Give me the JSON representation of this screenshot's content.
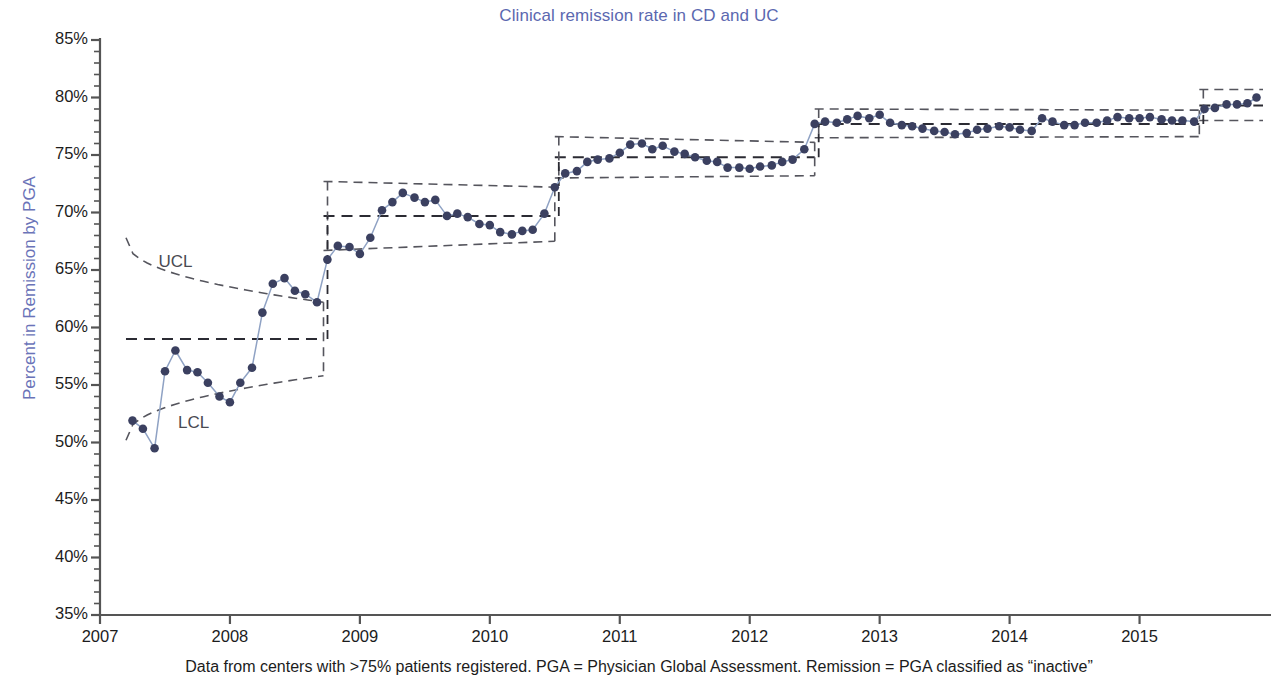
{
  "chart_data": {
    "type": "line",
    "title": "Clinical remission rate in CD and UC",
    "xlabel": "",
    "ylabel": "Percent in Remission by PGA",
    "footnote": "Data from centers with >75% patients registered. PGA = Physician Global Assessment. Remission = PGA classified as “inactive”",
    "xlim": [
      2007.0,
      2015.95
    ],
    "ylim": [
      35,
      85
    ],
    "y_tick_labels": [
      "85%",
      "80%",
      "75%",
      "70%",
      "65%",
      "60%",
      "55%",
      "50%",
      "45%",
      "40%",
      "35%"
    ],
    "y_ticks": [
      85,
      80,
      75,
      70,
      65,
      60,
      55,
      50,
      45,
      40,
      35
    ],
    "y_minor_step": 1,
    "x_tick_labels": [
      "2007",
      "2008",
      "2009",
      "2010",
      "2011",
      "2012",
      "2013",
      "2014",
      "2015"
    ],
    "x_ticks": [
      2007,
      2008,
      2009,
      2010,
      2011,
      2012,
      2013,
      2014,
      2015
    ],
    "grid": false,
    "legend": "none",
    "annotations": [
      {
        "text": "UCL",
        "x": 2007.45,
        "y": 65.6
      },
      {
        "text": "LCL",
        "x": 2007.6,
        "y": 51.6
      }
    ],
    "colors": {
      "title": "#5b68b0",
      "ylabel": "#6a73b8",
      "marker": "#3b4060",
      "line": "#8fa2c4",
      "control_limits": "#55555d",
      "axis": "#555555",
      "footnote": "#1c1c1c"
    },
    "series": [
      {
        "name": "Percent in Remission by PGA",
        "x": [
          2007.25,
          2007.33,
          2007.42,
          2007.5,
          2007.58,
          2007.67,
          2007.75,
          2007.83,
          2007.92,
          2008.0,
          2008.08,
          2008.17,
          2008.25,
          2008.33,
          2008.42,
          2008.5,
          2008.58,
          2008.67,
          2008.75,
          2008.83,
          2008.92,
          2009.0,
          2009.08,
          2009.17,
          2009.25,
          2009.33,
          2009.42,
          2009.5,
          2009.58,
          2009.67,
          2009.75,
          2009.83,
          2009.92,
          2010.0,
          2010.08,
          2010.17,
          2010.25,
          2010.33,
          2010.42,
          2010.5,
          2010.58,
          2010.67,
          2010.75,
          2010.83,
          2010.92,
          2011.0,
          2011.08,
          2011.17,
          2011.25,
          2011.33,
          2011.42,
          2011.5,
          2011.58,
          2011.67,
          2011.75,
          2011.83,
          2011.92,
          2012.0,
          2012.08,
          2012.17,
          2012.25,
          2012.33,
          2012.42,
          2012.5,
          2012.58,
          2012.67,
          2012.75,
          2012.83,
          2012.92,
          2013.0,
          2013.08,
          2013.17,
          2013.25,
          2013.33,
          2013.42,
          2013.5,
          2013.58,
          2013.67,
          2013.75,
          2013.83,
          2013.92,
          2014.0,
          2014.08,
          2014.17,
          2014.25,
          2014.33,
          2014.42,
          2014.5,
          2014.58,
          2014.67,
          2014.75,
          2014.83,
          2014.92,
          2015.0,
          2015.08,
          2015.17,
          2015.25,
          2015.33,
          2015.42,
          2015.5,
          2015.58,
          2015.67,
          2015.75,
          2015.83,
          2015.9
        ],
        "y": [
          51.9,
          51.2,
          49.5,
          56.2,
          58.0,
          56.3,
          56.1,
          55.2,
          54.0,
          53.5,
          55.2,
          56.5,
          61.3,
          63.8,
          64.3,
          63.2,
          62.9,
          62.2,
          65.9,
          67.1,
          67.0,
          66.4,
          67.8,
          70.2,
          70.9,
          71.7,
          71.3,
          70.9,
          71.1,
          69.7,
          69.9,
          69.6,
          69.0,
          68.9,
          68.3,
          68.1,
          68.4,
          68.5,
          69.9,
          72.2,
          73.4,
          73.6,
          74.4,
          74.6,
          74.7,
          75.2,
          75.9,
          76.0,
          75.5,
          75.8,
          75.3,
          75.1,
          74.8,
          74.5,
          74.4,
          73.9,
          73.9,
          73.8,
          74.0,
          74.1,
          74.4,
          74.6,
          75.5,
          77.7,
          77.9,
          77.8,
          78.1,
          78.4,
          78.2,
          78.5,
          77.8,
          77.6,
          77.5,
          77.3,
          77.1,
          77.0,
          76.8,
          76.9,
          77.2,
          77.3,
          77.5,
          77.4,
          77.2,
          77.1,
          78.2,
          77.9,
          77.6,
          77.6,
          77.8,
          77.8,
          78.0,
          78.3,
          78.2,
          78.2,
          78.3,
          78.1,
          78.0,
          78.0,
          77.9,
          79.0,
          79.1,
          79.4,
          79.4,
          79.5,
          80.0
        ]
      }
    ],
    "control_phases": [
      {
        "start": 2007.2,
        "end": 2008.72,
        "center": 59.0,
        "ucl_start": 67.8,
        "ucl_end": 62.2,
        "lcl_start": 50.2,
        "lcl_end": 55.8,
        "curved": true
      },
      {
        "start": 2008.72,
        "end": 2010.5,
        "center": 69.7,
        "ucl_start": 72.7,
        "ucl_end": 72.2,
        "lcl_start": 66.7,
        "lcl_end": 67.5,
        "curved": false
      },
      {
        "start": 2010.5,
        "end": 2012.5,
        "center": 74.8,
        "ucl_start": 76.6,
        "ucl_end": 76.1,
        "lcl_start": 73.0,
        "lcl_end": 73.2,
        "curved": false
      },
      {
        "start": 2012.5,
        "end": 2015.46,
        "center": 77.7,
        "ucl_start": 79.0,
        "ucl_end": 78.9,
        "lcl_start": 76.5,
        "lcl_end": 76.6,
        "curved": false
      },
      {
        "start": 2015.46,
        "end": 2015.95,
        "center": 79.3,
        "ucl_start": 80.7,
        "ucl_end": 80.7,
        "lcl_start": 78.0,
        "lcl_end": 78.0,
        "curved": false
      }
    ]
  }
}
